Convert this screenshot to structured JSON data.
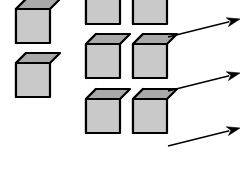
{
  "figure": {
    "type": "diagram",
    "background_color": "#FFFFFF",
    "cube": {
      "front_face_color": "#C9C9C9",
      "left_face_color": "#999999",
      "top_face_color": "#A9A9A9",
      "outline_color": "#000000",
      "outline_width": 2.2,
      "front_width": 34,
      "front_height": 34,
      "depth_x": 10,
      "depth_y": 10
    },
    "arrow": {
      "color": "#000000",
      "line_width": 1.6,
      "head_length": 13,
      "head_width": 9,
      "count": 3
    },
    "groups": [
      {
        "name": "left-group",
        "label": "left-cube-group",
        "cube_count": 2,
        "cubes": [
          {
            "name": "left-cube-1",
            "x": 16,
            "y": 43
          },
          {
            "name": "left-cube-2",
            "x": 16,
            "y": 97
          }
        ]
      },
      {
        "name": "right-group",
        "label": "right-cube-grid",
        "cube_count": 6,
        "rows": 3,
        "columns": 2,
        "cubes": [
          {
            "name": "right-cube-r1c1",
            "x": 86,
            "y": 24
          },
          {
            "name": "right-cube-r1c2",
            "x": 133,
            "y": 24
          },
          {
            "name": "right-cube-r2c1",
            "x": 86,
            "y": 78
          },
          {
            "name": "right-cube-r2c2",
            "x": 133,
            "y": 78
          },
          {
            "name": "right-cube-r3c1",
            "x": 86,
            "y": 133
          },
          {
            "name": "right-cube-r3c2",
            "x": 133,
            "y": 133
          }
        ]
      }
    ],
    "arrows": [
      {
        "name": "arrow-row-1",
        "x1": 168,
        "y1": 37,
        "x2": 240,
        "y2": 19
      },
      {
        "name": "arrow-row-2",
        "x1": 168,
        "y1": 91,
        "x2": 240,
        "y2": 73
      },
      {
        "name": "arrow-row-3",
        "x1": 168,
        "y1": 146,
        "x2": 240,
        "y2": 128
      }
    ]
  }
}
